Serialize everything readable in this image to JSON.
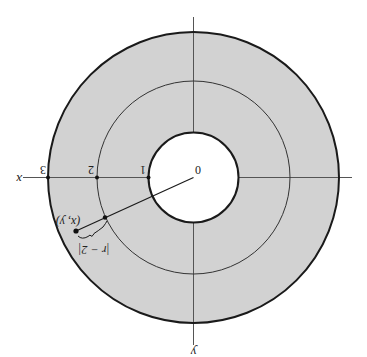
{
  "figure": {
    "rotation_deg": 180,
    "colors": {
      "annulus_fill": "#d2d2d2",
      "stroke": "#1a1a1a",
      "axis": "#555555",
      "background": "#ffffff"
    },
    "geometry": {
      "center": [
        193.5,
        177.5
      ],
      "unit_px": 48.5,
      "inner_radius": 1,
      "middle_radius": 2,
      "outer_radius": 3
    },
    "axes": {
      "x_label": "x",
      "y_label": "y"
    },
    "tick_labels": [
      "0",
      "1",
      "2",
      "3"
    ],
    "point": {
      "label": "(x, y)",
      "position_px": [
        76,
        231
      ]
    },
    "distance_label": "|r − 2|",
    "cropped_caption_fragment": "· · · · · · · · · · · ·"
  }
}
